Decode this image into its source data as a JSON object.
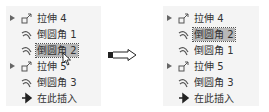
{
  "left_tree": {
    "items": [
      {
        "label": "拉伸 4",
        "type": "extrude",
        "expandable": true
      },
      {
        "label": "倒圆角 1",
        "type": "round"
      },
      {
        "label": "倒圆角 2",
        "type": "round",
        "selected": true
      },
      {
        "label": "拉伸 5",
        "type": "extrude",
        "expandable": true
      },
      {
        "label": "倒圆角 3",
        "type": "round"
      },
      {
        "label": "在此插入",
        "type": "insert"
      }
    ]
  },
  "right_tree": {
    "items": [
      {
        "label": "拉伸 4",
        "type": "extrude",
        "expandable": true
      },
      {
        "label": "倒圆角 2",
        "type": "round",
        "selected": true
      },
      {
        "label": "倒圆角 1",
        "type": "round"
      },
      {
        "label": "拉伸 5",
        "type": "extrude",
        "expandable": true
      },
      {
        "label": "倒圆角 3",
        "type": "round"
      },
      {
        "label": "在此插入",
        "type": "insert"
      }
    ]
  },
  "transition_arrow": "right-arrow-icon",
  "colors": {
    "selection": "#b8b8b8",
    "panel": "#f4f4f4",
    "text": "#333333"
  }
}
